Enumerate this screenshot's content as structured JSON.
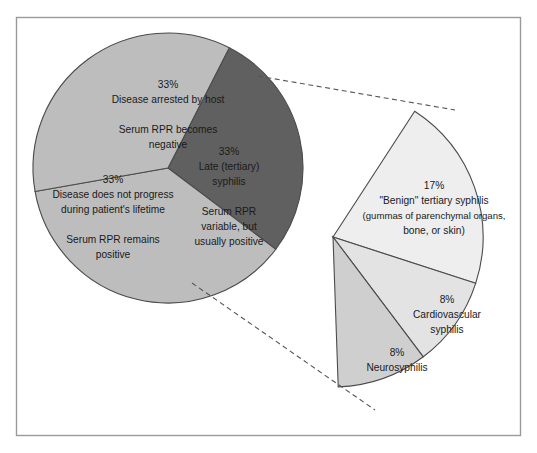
{
  "figure": {
    "frame": {
      "border_color": "#9a9a9a",
      "background_color": "#ffffff"
    }
  },
  "colors": {
    "wedge_dark": "#606060",
    "wedge_mid": "#bdbdbd",
    "wedge_light": "#eeeeee",
    "wedge_light_alt": "#e3e3e3",
    "wedge_light_dark": "#cfcfcf",
    "outline": "#4a4a4a",
    "leader_line": "#555555",
    "text": "#1a1a1a"
  },
  "chart_data": {
    "type": "pie",
    "legend_position": "none",
    "main_pie": {
      "center": [
        168,
        168
      ],
      "radius": 135,
      "slices": [
        {
          "id": "disease-arrested",
          "percent": 33,
          "percent_label": "33%",
          "label_lines": [
            "33%",
            "Disease arrested by host",
            "",
            "Serum RPR becomes",
            "negative"
          ],
          "color": "#606060",
          "start_angle": -63,
          "end_angle": 37
        },
        {
          "id": "late-tertiary-syphilis",
          "percent": 33,
          "percent_label": "33%",
          "label_lines": [
            "33%",
            "Late (tertiary)",
            "syphilis",
            "",
            "Serum RPR",
            "variable, but",
            "usually positive"
          ],
          "color": "#bdbdbd",
          "start_angle": 37,
          "end_angle": 170
        },
        {
          "id": "disease-does-not-progress",
          "percent": 33,
          "percent_label": "33%",
          "label_lines": [
            "33%",
            "Disease does not progress",
            "during patient's lifetime",
            "",
            "Serum RPR remains",
            "positive"
          ],
          "color": "#bdbdbd",
          "start_angle": 170,
          "end_angle": 297
        }
      ]
    },
    "exploded_fan": {
      "apex": [
        333,
        237
      ],
      "radius": 150,
      "note": "Breakdown of the 33% late (tertiary) syphilis slice",
      "slices": [
        {
          "id": "benign-tertiary-syphilis",
          "percent": 17,
          "percent_label": "17%",
          "label_lines": [
            "17%",
            "\"Benign\" tertiary syphilis",
            "(gummas of parenchymal organs,",
            "bone, or skin)"
          ],
          "color": "#eeeeee",
          "start_angle": -57,
          "end_angle": 18
        },
        {
          "id": "cardiovascular-syphilis",
          "percent": 8,
          "percent_label": "8%",
          "label_lines": [
            "8%",
            "Cardiovascular",
            "syphilis"
          ],
          "color": "#e3e3e3",
          "start_angle": 18,
          "end_angle": 53
        },
        {
          "id": "neurosyphilis",
          "percent": 8,
          "percent_label": "8%",
          "label_lines": [
            "8%",
            "Neurosyphilis"
          ],
          "color": "#cfcfcf",
          "start_angle": 53,
          "end_angle": 88
        }
      ]
    },
    "leader_lines": [
      {
        "id": "upper-leader",
        "from": [
          258,
          76
        ],
        "to": [
          455,
          110
        ]
      },
      {
        "id": "lower-leader",
        "from": [
          192,
          283
        ],
        "to": [
          375,
          410
        ]
      }
    ]
  },
  "labels": {
    "main": {
      "arrested": {
        "l1": "33%",
        "l2": "Disease arrested by host",
        "l3": "Serum RPR becomes",
        "l4": "negative"
      },
      "late": {
        "l1": "33%",
        "l2": "Late (tertiary)",
        "l3": "syphilis",
        "l4": "Serum RPR",
        "l5": "variable, but",
        "l6": "usually positive"
      },
      "noprogress": {
        "l1": "33%",
        "l2": "Disease does not progress",
        "l3": "during patient's lifetime",
        "l4": "Serum RPR remains",
        "l5": "positive"
      }
    },
    "fan": {
      "benign": {
        "l1": "17%",
        "l2": "\"Benign\" tertiary syphilis",
        "l3": "(gummas of parenchymal organs,",
        "l4": "bone, or skin)"
      },
      "cardio": {
        "l1": "8%",
        "l2": "Cardiovascular",
        "l3": "syphilis"
      },
      "neuro": {
        "l1": "8%",
        "l2": "Neurosyphilis"
      }
    }
  }
}
